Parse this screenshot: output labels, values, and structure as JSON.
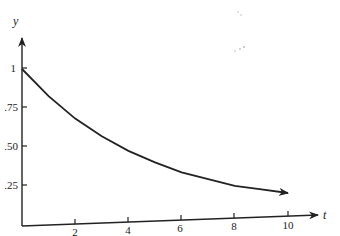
{
  "chart_data": {
    "type": "line",
    "title": "",
    "xlabel": "t",
    "ylabel": "y",
    "xlim": [
      0,
      10.5
    ],
    "ylim": [
      0,
      1.1
    ],
    "grid": false,
    "legend": null,
    "x_ticks": [
      2,
      4,
      6,
      8,
      10
    ],
    "x_tick_labels": [
      "2",
      "4",
      "6",
      "8",
      "10"
    ],
    "y_ticks": [
      0.25,
      0.5,
      0.75,
      1
    ],
    "y_tick_labels": [
      ".25",
      ".50",
      ".75",
      "1"
    ],
    "series": [
      {
        "name": "y = e^(-t/5)",
        "x": [
          0,
          1,
          2,
          3,
          4,
          5,
          6,
          7,
          8,
          9,
          10
        ],
        "values": [
          1.0,
          0.82,
          0.67,
          0.55,
          0.45,
          0.37,
          0.3,
          0.25,
          0.2,
          0.17,
          0.14
        ]
      }
    ],
    "annotations": [
      "arrowhead at end of curve near t=10"
    ]
  },
  "axes": {
    "x_name": "t",
    "y_name": "y"
  }
}
